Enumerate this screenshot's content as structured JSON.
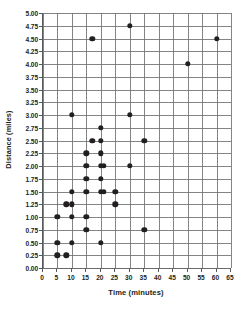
{
  "chart_data": {
    "type": "scatter",
    "title": "",
    "xlabel": "Time (minutes)",
    "ylabel": "Distance (miles)",
    "xlim": [
      0,
      65
    ],
    "ylim": [
      0,
      5.0
    ],
    "xticks": [
      0,
      5,
      10,
      15,
      20,
      25,
      30,
      35,
      40,
      45,
      50,
      55,
      60,
      65
    ],
    "xtick_labels": [
      "0",
      "5",
      "10",
      "15",
      "20",
      "25",
      "30",
      "35",
      "40",
      "45",
      "50",
      "55",
      "60",
      "65"
    ],
    "yticks": [
      0,
      0.25,
      0.5,
      0.75,
      1.0,
      1.25,
      1.5,
      1.75,
      2.0,
      2.25,
      2.5,
      2.75,
      3.0,
      3.25,
      3.5,
      3.75,
      4.0,
      4.25,
      4.5,
      4.75,
      5.0
    ],
    "ytick_labels": [
      "0.00",
      "0.25",
      "0.50",
      "0.75",
      "1.00",
      "1.25",
      "1.50",
      "1.75",
      "2.00",
      "2.25",
      "2.50",
      "2.75",
      "3.00",
      "3.25",
      "3.50",
      "3.75",
      "4.00",
      "4.25",
      "4.50",
      "4.75",
      "5.00"
    ],
    "grid": true,
    "legend": false,
    "marker_color": "#231f20",
    "grid_color": "#6d6e71",
    "axis_color": "#58595b",
    "points": [
      {
        "x": 5,
        "y": 0.25
      },
      {
        "x": 8,
        "y": 0.25
      },
      {
        "x": 5,
        "y": 0.5
      },
      {
        "x": 10,
        "y": 0.5
      },
      {
        "x": 20,
        "y": 0.5
      },
      {
        "x": 15,
        "y": 0.75
      },
      {
        "x": 35,
        "y": 0.75
      },
      {
        "x": 5,
        "y": 1.0
      },
      {
        "x": 10,
        "y": 1.0
      },
      {
        "x": 15,
        "y": 1.0
      },
      {
        "x": 8,
        "y": 1.25
      },
      {
        "x": 10,
        "y": 1.25
      },
      {
        "x": 25,
        "y": 1.25
      },
      {
        "x": 10,
        "y": 1.5
      },
      {
        "x": 15,
        "y": 1.5
      },
      {
        "x": 20,
        "y": 1.5
      },
      {
        "x": 21,
        "y": 1.5
      },
      {
        "x": 25,
        "y": 1.5
      },
      {
        "x": 15,
        "y": 1.75
      },
      {
        "x": 20,
        "y": 1.75
      },
      {
        "x": 15,
        "y": 2.0
      },
      {
        "x": 20,
        "y": 2.0
      },
      {
        "x": 21,
        "y": 2.0
      },
      {
        "x": 30,
        "y": 2.0
      },
      {
        "x": 15,
        "y": 2.25
      },
      {
        "x": 20,
        "y": 2.25
      },
      {
        "x": 17,
        "y": 2.5
      },
      {
        "x": 20,
        "y": 2.5
      },
      {
        "x": 35,
        "y": 2.5
      },
      {
        "x": 20,
        "y": 2.75
      },
      {
        "x": 10,
        "y": 3.0
      },
      {
        "x": 30,
        "y": 3.0
      },
      {
        "x": 50,
        "y": 4.0
      },
      {
        "x": 17,
        "y": 4.5
      },
      {
        "x": 60,
        "y": 4.5
      },
      {
        "x": 30,
        "y": 4.75
      }
    ]
  }
}
